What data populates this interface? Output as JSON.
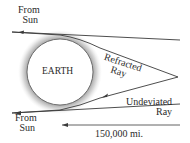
{
  "diagram": {
    "labels": {
      "top_source": [
        "From",
        "Sun"
      ],
      "bottom_source": [
        "From",
        "Sun"
      ],
      "earth": "EARTH",
      "refracted": [
        "Refracted",
        "Ray"
      ],
      "undeviated": [
        "Undeviated",
        "Ray"
      ],
      "distance": "150,000 mi."
    },
    "colors": {
      "line": "#3a3a3a",
      "atmosphere": "#b8b8b8",
      "earth_fill": "#ffffff"
    }
  }
}
